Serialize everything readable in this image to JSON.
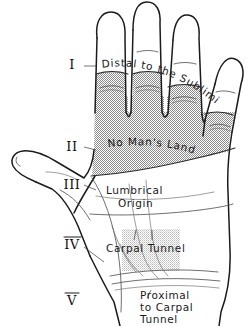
{
  "figure": {
    "background_color": "#ffffff",
    "ink_color": "#1b1b1b",
    "shading_color": "#9a9a9a",
    "carpal_shading_color": "#b9b9b9"
  },
  "zones": [
    {
      "id": "zone-1",
      "numeral": "I",
      "x": 72,
      "y": 65
    },
    {
      "id": "zone-2",
      "numeral": "II",
      "x": 72,
      "y": 147
    },
    {
      "id": "zone-3",
      "numeral": "III",
      "x": 72,
      "y": 185
    },
    {
      "id": "zone-4",
      "numeral": "IV",
      "x": 72,
      "y": 245
    },
    {
      "id": "zone-5",
      "numeral": "V",
      "x": 72,
      "y": 301
    }
  ],
  "labels": {
    "zone1": "Distal   to   the   Sublimis",
    "zone2": "No Man's Land",
    "zone3_line1": "Lumbrical",
    "zone3_line2": "Origin",
    "zone4": "Carpal Tunnel",
    "zone5_line1": "Proximal",
    "zone5_line2": "to Carpal",
    "zone5_line3": "Tunnel"
  }
}
